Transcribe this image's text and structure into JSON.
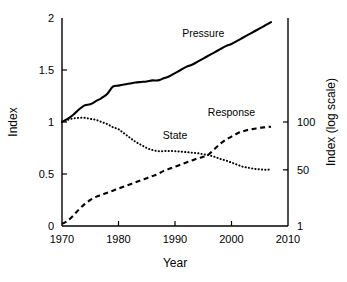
{
  "chart_data": {
    "type": "line",
    "title": "",
    "xlabel": "Year",
    "ylabel": "Index",
    "ylabel_right": "Index (log scale)",
    "xlim": [
      1970,
      2010
    ],
    "ylim": [
      0,
      2
    ],
    "ylim_right_log": [
      1,
      110
    ],
    "grid": false,
    "legend": "inline-annotations",
    "xticks": [
      1970,
      1980,
      1990,
      2000,
      2010
    ],
    "xticklabels": [
      "1970",
      "1980",
      "1990",
      "2000",
      "2010"
    ],
    "yticks": [
      0,
      0.5,
      1,
      1.5,
      2
    ],
    "yticklabels": [
      "0",
      "0.5",
      "1",
      "1.5",
      "2"
    ],
    "yticks_right": [
      1,
      50,
      100
    ],
    "yticklabels_right": [
      "1",
      "50",
      "100"
    ],
    "series": [
      {
        "name": "Pressure",
        "style": "solid",
        "label_x": 1995,
        "label_y": 1.82,
        "x": [
          1970,
          1971,
          1972,
          1973,
          1974,
          1975,
          1976,
          1977,
          1978,
          1979,
          1980,
          1981,
          1982,
          1983,
          1984,
          1985,
          1986,
          1987,
          1988,
          1989,
          1990,
          1991,
          1992,
          1993,
          1994,
          1995,
          1996,
          1997,
          1998,
          1999,
          2000,
          2001,
          2002,
          2003,
          2004,
          2005,
          2006,
          2007
        ],
        "values": [
          1.0,
          1.03,
          1.07,
          1.12,
          1.16,
          1.17,
          1.2,
          1.23,
          1.27,
          1.34,
          1.35,
          1.36,
          1.37,
          1.38,
          1.385,
          1.39,
          1.4,
          1.4,
          1.42,
          1.44,
          1.47,
          1.5,
          1.53,
          1.55,
          1.58,
          1.61,
          1.64,
          1.67,
          1.7,
          1.73,
          1.75,
          1.78,
          1.81,
          1.84,
          1.87,
          1.9,
          1.93,
          1.96
        ]
      },
      {
        "name": "State",
        "style": "dotted",
        "label_x": 1990,
        "label_y": 0.84,
        "x": [
          1970,
          1971,
          1972,
          1973,
          1974,
          1975,
          1976,
          1977,
          1978,
          1979,
          1980,
          1981,
          1982,
          1983,
          1984,
          1985,
          1986,
          1987,
          1988,
          1989,
          1990,
          1991,
          1992,
          1993,
          1994,
          1995,
          1996,
          1997,
          1998,
          1999,
          2000,
          2001,
          2002,
          2003,
          2004,
          2005,
          2006,
          2007
        ],
        "values": [
          1.0,
          1.02,
          1.035,
          1.04,
          1.04,
          1.03,
          1.02,
          1.0,
          0.98,
          0.95,
          0.93,
          0.89,
          0.85,
          0.81,
          0.78,
          0.75,
          0.73,
          0.72,
          0.72,
          0.72,
          0.72,
          0.715,
          0.71,
          0.705,
          0.7,
          0.69,
          0.68,
          0.665,
          0.645,
          0.63,
          0.61,
          0.59,
          0.57,
          0.56,
          0.55,
          0.545,
          0.54,
          0.545
        ]
      },
      {
        "name": "Response",
        "style": "dashed",
        "label_x": 2000,
        "label_y": 1.06,
        "x": [
          1970,
          1971,
          1972,
          1973,
          1974,
          1975,
          1976,
          1977,
          1978,
          1979,
          1980,
          1981,
          1982,
          1983,
          1984,
          1985,
          1986,
          1987,
          1988,
          1989,
          1990,
          1991,
          1992,
          1993,
          1994,
          1995,
          1996,
          1997,
          1998,
          1999,
          2000,
          2001,
          2002,
          2003,
          2004,
          2005,
          2006,
          2007
        ],
        "values": [
          0.02,
          0.05,
          0.1,
          0.16,
          0.21,
          0.25,
          0.28,
          0.3,
          0.32,
          0.34,
          0.36,
          0.38,
          0.4,
          0.42,
          0.44,
          0.46,
          0.48,
          0.5,
          0.53,
          0.55,
          0.57,
          0.59,
          0.61,
          0.63,
          0.65,
          0.665,
          0.69,
          0.74,
          0.79,
          0.83,
          0.86,
          0.89,
          0.91,
          0.925,
          0.935,
          0.945,
          0.95,
          0.955
        ]
      }
    ]
  }
}
